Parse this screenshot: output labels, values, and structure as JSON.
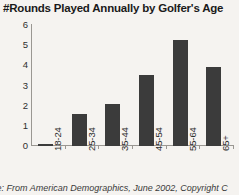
{
  "chart_data": {
    "type": "bar",
    "title": "#Rounds Played Annually by Golfer's Age",
    "xlabel": "",
    "ylabel": "",
    "categories": [
      "18-24",
      "25-34",
      "35-44",
      "45-54",
      "55-64",
      "65+"
    ],
    "values": [
      0.1,
      1.6,
      2.1,
      3.5,
      5.25,
      3.9
    ],
    "ylim": [
      0,
      6
    ],
    "yticks": [
      0,
      1,
      2,
      3,
      4,
      5,
      6
    ],
    "ytick_labels": [
      "0",
      "1",
      "2",
      "3",
      "4",
      "5",
      "6"
    ],
    "grid": false,
    "legend": null,
    "bar_color": "#3b3b3b",
    "background_color": "#f5f3f0",
    "axis_color": "#9a9792"
  },
  "footer": {
    "source_note": "ce: From American Demographics, June 2002, Copyright C"
  }
}
